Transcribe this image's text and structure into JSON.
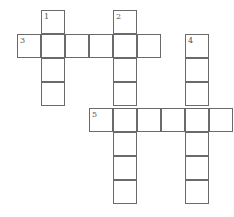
{
  "puzzle": {
    "type": "crossword",
    "cell_size": 24,
    "cells": [
      {
        "x": 41,
        "y": 10,
        "num": "1"
      },
      {
        "x": 113,
        "y": 10,
        "num": "2"
      },
      {
        "x": 17,
        "y": 34,
        "num": "3"
      },
      {
        "x": 41,
        "y": 34,
        "num": ""
      },
      {
        "x": 65,
        "y": 34,
        "num": ""
      },
      {
        "x": 89,
        "y": 34,
        "num": ""
      },
      {
        "x": 113,
        "y": 34,
        "num": ""
      },
      {
        "x": 137,
        "y": 34,
        "num": ""
      },
      {
        "x": 185,
        "y": 34,
        "num": "4"
      },
      {
        "x": 41,
        "y": 58,
        "num": ""
      },
      {
        "x": 113,
        "y": 58,
        "num": ""
      },
      {
        "x": 185,
        "y": 58,
        "num": ""
      },
      {
        "x": 41,
        "y": 82,
        "num": ""
      },
      {
        "x": 113,
        "y": 82,
        "num": ""
      },
      {
        "x": 185,
        "y": 82,
        "num": ""
      },
      {
        "x": 89,
        "y": 108,
        "num": "5"
      },
      {
        "x": 113,
        "y": 108,
        "num": ""
      },
      {
        "x": 137,
        "y": 108,
        "num": ""
      },
      {
        "x": 161,
        "y": 108,
        "num": ""
      },
      {
        "x": 185,
        "y": 108,
        "num": ""
      },
      {
        "x": 209,
        "y": 108,
        "num": ""
      },
      {
        "x": 113,
        "y": 132,
        "num": ""
      },
      {
        "x": 185,
        "y": 132,
        "num": ""
      },
      {
        "x": 113,
        "y": 156,
        "num": ""
      },
      {
        "x": 185,
        "y": 156,
        "num": ""
      },
      {
        "x": 113,
        "y": 180,
        "num": ""
      },
      {
        "x": 185,
        "y": 180,
        "num": ""
      }
    ],
    "words": [
      {
        "number": "1",
        "direction": "down",
        "length": 4
      },
      {
        "number": "2",
        "direction": "down",
        "length": 8
      },
      {
        "number": "3",
        "direction": "across",
        "length": 6
      },
      {
        "number": "4",
        "direction": "down",
        "length": 7
      },
      {
        "number": "5",
        "direction": "across",
        "length": 6
      }
    ],
    "colors": {
      "border": "#6a6a6a",
      "cell_bg": "#ffffff",
      "number": "#555555"
    }
  }
}
